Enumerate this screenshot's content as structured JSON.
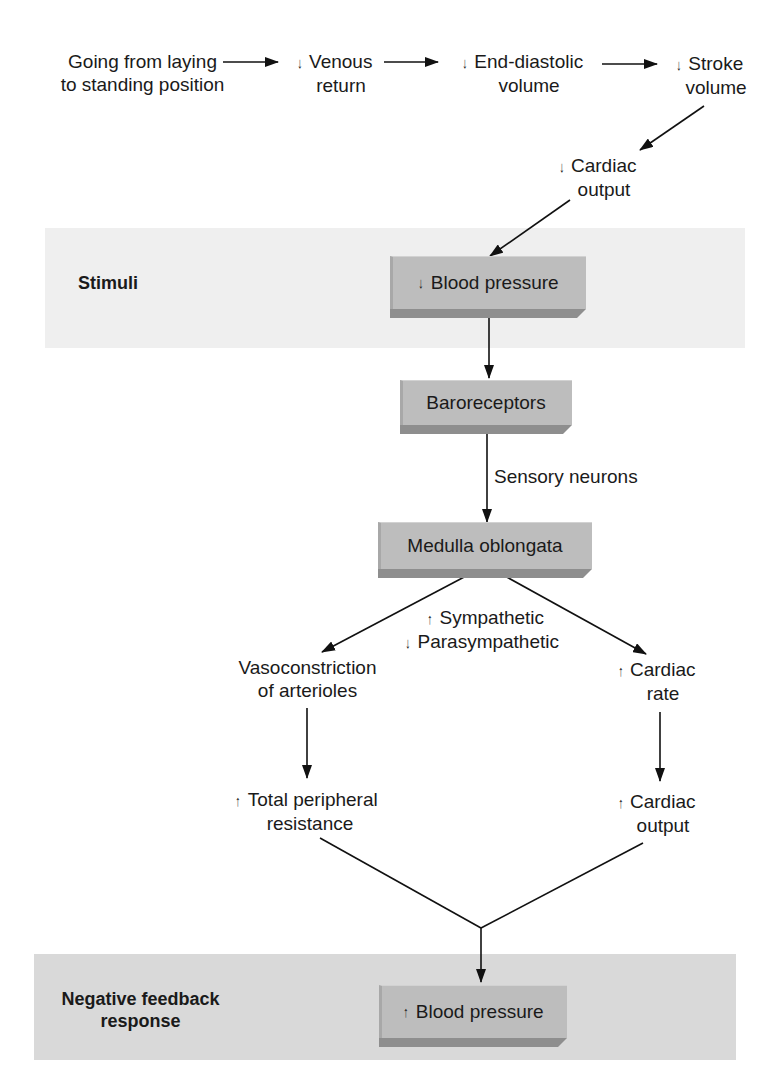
{
  "diagram": {
    "bands": {
      "stimuli": {
        "label": "Stimuli",
        "color": "#efefef"
      },
      "response": {
        "label_line1": "Negative feedback",
        "label_line2": "response",
        "color": "#d9d9d9"
      }
    },
    "chain": [
      {
        "id": "posture",
        "line1": "Going from laying",
        "line2": "to standing position",
        "arrow": ""
      },
      {
        "id": "venous-return",
        "line1": "Venous",
        "line2": "return",
        "arrow": "↓"
      },
      {
        "id": "edv",
        "line1": "End-diastolic",
        "line2": "volume",
        "arrow": "↓"
      },
      {
        "id": "stroke-volume",
        "line1": "Stroke",
        "line2": "volume",
        "arrow": "↓"
      },
      {
        "id": "cardiac-output-decrease",
        "line1": "Cardiac",
        "line2": "output",
        "arrow": "↓"
      }
    ],
    "boxes": {
      "bp_low": {
        "arrow": "↓",
        "label": "Blood pressure"
      },
      "baroreceptors": {
        "label": "Baroreceptors"
      },
      "medulla": {
        "label": "Medulla oblongata"
      },
      "bp_high": {
        "arrow": "↑",
        "label": "Blood pressure"
      }
    },
    "edge_labels": {
      "sensory": "Sensory neurons",
      "sympathetic": {
        "arrow": "↑",
        "label": "Sympathetic"
      },
      "parasympathetic": {
        "arrow": "↓",
        "label": "Parasympathetic"
      }
    },
    "left_branch": {
      "step1": {
        "line1": "Vasoconstriction",
        "line2": "of arterioles"
      },
      "step2": {
        "arrow": "↑",
        "line1": "Total peripheral",
        "line2": "resistance"
      }
    },
    "right_branch": {
      "step1": {
        "arrow": "↑",
        "line1": "Cardiac",
        "line2": "rate"
      },
      "step2": {
        "arrow": "↑",
        "line1": "Cardiac",
        "line2": "output"
      }
    },
    "colors": {
      "box_face": "#bdbdbd",
      "box_bevel": "#8e8e8e",
      "line": "#111111"
    }
  }
}
